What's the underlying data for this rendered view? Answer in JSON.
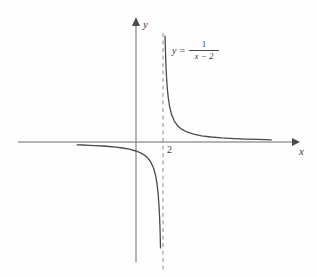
{
  "figure": {
    "background_color": "#fefefe",
    "stroke_color": "#4a4a4a",
    "axis_color": "#6b6b6b",
    "text_color": "#3d3d3d"
  },
  "labels": {
    "y_axis": "y",
    "x_axis": "x",
    "tick_2": "2",
    "equation_lhs": "y",
    "equation_equals": "=",
    "equation_numerator": "1",
    "equation_denominator": "x − 2"
  },
  "chart_data": {
    "type": "line",
    "title": "",
    "subtitle": "",
    "xlabel": "x",
    "ylabel": "y",
    "function": "y = 1/(x - 2)",
    "grid": false,
    "legend": null,
    "annotations": [
      {
        "text": "y = 1/(x - 2)",
        "x": 4.6,
        "y": 2.6,
        "role": "curve-equation"
      }
    ],
    "asymptotes": [
      {
        "type": "vertical",
        "x": 2,
        "style": "dashed",
        "label": "2"
      },
      {
        "type": "horizontal",
        "y": 0,
        "style": "axis"
      }
    ],
    "tick_labels": {
      "x": [
        "2"
      ],
      "y": []
    },
    "xlim": [
      -4.4,
      10.1
    ],
    "ylim": [
      -4.0,
      3.45
    ],
    "axis_origin": {
      "x": 0,
      "y": 0
    },
    "series": [
      {
        "name": "left-branch",
        "comment": "x < 2, y negative",
        "x": [
          -4.4,
          -4.0,
          -3.5,
          -3.0,
          -2.5,
          -2.0,
          -1.5,
          -1.0,
          -0.5,
          0.0,
          0.3,
          0.6,
          0.9,
          1.1,
          1.3,
          1.45,
          1.57,
          1.66,
          1.72,
          1.76,
          1.79,
          1.815,
          1.83
        ],
        "y": [
          -0.156,
          -0.167,
          -0.182,
          -0.2,
          -0.222,
          -0.25,
          -0.286,
          -0.333,
          -0.4,
          -0.5,
          -0.588,
          -0.714,
          -0.909,
          -1.111,
          -1.429,
          -1.818,
          -2.326,
          -2.941,
          -3.571,
          -4.167,
          -4.762,
          -5.405,
          -5.882
        ]
      },
      {
        "name": "right-branch",
        "comment": "x > 2, y positive",
        "x": [
          2.17,
          2.2,
          2.23,
          2.27,
          2.32,
          2.4,
          2.5,
          2.65,
          2.85,
          3.1,
          3.4,
          3.8,
          4.3,
          4.9,
          5.6,
          6.4,
          7.3,
          8.2,
          9.1,
          10.1
        ],
        "y": [
          5.882,
          5.0,
          4.348,
          3.704,
          3.125,
          2.5,
          2.0,
          1.538,
          1.176,
          0.909,
          0.714,
          0.556,
          0.435,
          0.345,
          0.278,
          0.227,
          0.189,
          0.161,
          0.141,
          0.123
        ]
      }
    ]
  },
  "geometry": {
    "comment": "pixel mapping used for rendering",
    "origin_px": {
      "x": 136,
      "y": 142
    },
    "scale_px_per_unit": {
      "x": 13.4,
      "y": 18.0
    },
    "x_axis_px": {
      "x1": 18,
      "x2": 298,
      "y": 142
    },
    "y_axis_px": {
      "y1": 20,
      "y2": 262,
      "x": 136
    },
    "asymptote_px": {
      "x": 163,
      "y1": 33,
      "y2": 270
    }
  }
}
